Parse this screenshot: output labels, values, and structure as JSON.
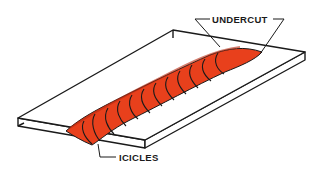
{
  "diagram": {
    "labels": {
      "undercut": "UNDERCUT",
      "icicles": "ICICLES"
    },
    "colors": {
      "bead": "#e8401c",
      "bead_shadow": "#b82a10",
      "outline": "#1a1a1a",
      "plate": "#ffffff"
    }
  }
}
